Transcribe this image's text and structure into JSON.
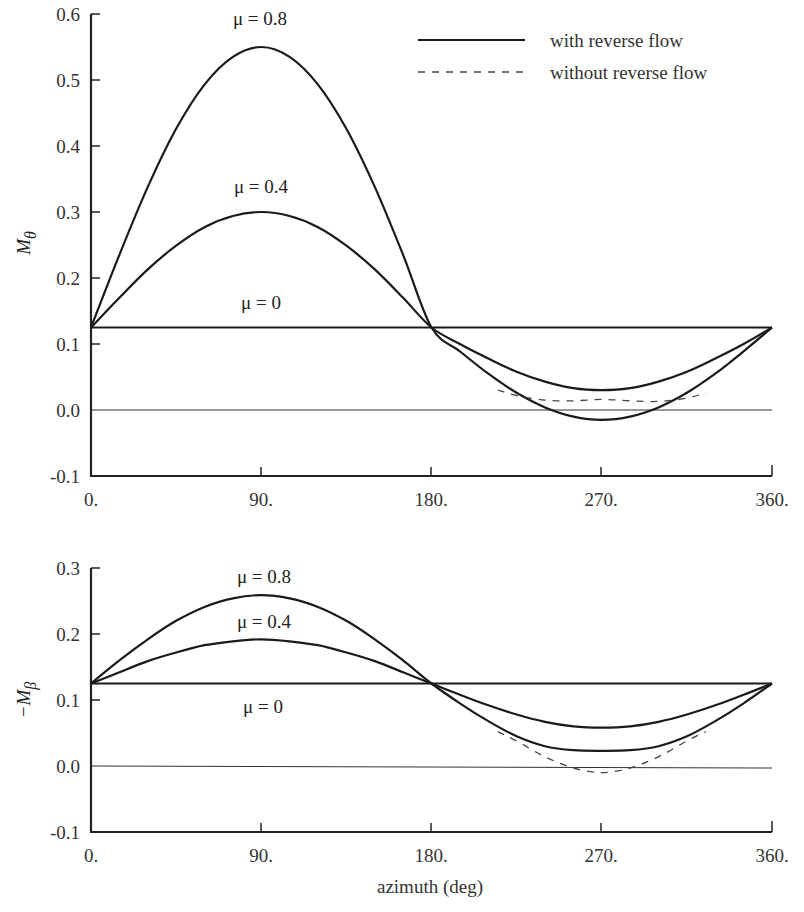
{
  "legend": {
    "solid_label": "with reverse flow",
    "dashed_label": "without reverse flow"
  },
  "xaxis": {
    "label": "azimuth (deg)",
    "ticks": [
      "0.",
      "90.",
      "180.",
      "270.",
      "360."
    ],
    "tick_values": [
      0,
      90,
      180,
      270,
      360
    ]
  },
  "top": {
    "ylabel": "M",
    "ylabel_sub": "θ",
    "yticks": [
      "0.6",
      "0.5",
      "0.4",
      "0.3",
      "0.2",
      "0.1",
      "0.0",
      "-0.1"
    ],
    "curve_labels": {
      "mu08": "μ = 0.8",
      "mu04": "μ = 0.4",
      "mu0": "μ = 0"
    }
  },
  "bottom": {
    "ylabel": "−M",
    "ylabel_sub": "β",
    "yticks": [
      "0.3",
      "0.2",
      "0.1",
      "0.0",
      "-0.1"
    ],
    "curve_labels": {
      "mu08": "μ = 0.8",
      "mu04": "μ = 0.4",
      "mu0": "μ = 0"
    }
  },
  "chart_data": [
    {
      "type": "line",
      "title": "",
      "xlabel": "azimuth (deg)",
      "ylabel": "M_θ",
      "xlim": [
        0,
        360
      ],
      "ylim": [
        -0.1,
        0.6
      ],
      "grid": false,
      "legend_position": "top-right",
      "x": [
        0,
        15,
        30,
        45,
        60,
        75,
        90,
        105,
        120,
        135,
        150,
        165,
        180,
        195,
        210,
        225,
        240,
        255,
        270,
        285,
        300,
        315,
        330,
        345,
        360
      ],
      "series": [
        {
          "name": "μ = 0 (with reverse flow)",
          "style": "solid",
          "values": [
            0.125,
            0.125,
            0.125,
            0.125,
            0.125,
            0.125,
            0.125,
            0.125,
            0.125,
            0.125,
            0.125,
            0.125,
            0.125,
            0.125,
            0.125,
            0.125,
            0.125,
            0.125,
            0.125,
            0.125,
            0.125,
            0.125,
            0.125,
            0.125,
            0.125
          ]
        },
        {
          "name": "μ = 0.4 (with reverse flow)",
          "style": "solid",
          "values": [
            0.125,
            0.17,
            0.213,
            0.249,
            0.277,
            0.294,
            0.3,
            0.294,
            0.277,
            0.249,
            0.213,
            0.17,
            0.125,
            0.1,
            0.078,
            0.058,
            0.043,
            0.033,
            0.03,
            0.033,
            0.043,
            0.058,
            0.078,
            0.1,
            0.125
          ]
        },
        {
          "name": "μ = 0.8 (with reverse flow)",
          "style": "solid",
          "values": [
            0.125,
            0.235,
            0.338,
            0.426,
            0.493,
            0.535,
            0.55,
            0.535,
            0.493,
            0.426,
            0.338,
            0.235,
            0.125,
            0.089,
            0.055,
            0.026,
            0.004,
            -0.01,
            -0.015,
            -0.01,
            0.004,
            0.026,
            0.055,
            0.089,
            0.125
          ]
        },
        {
          "name": "μ = 0.8 (without reverse flow)",
          "style": "dashed",
          "x": [
            215,
            225,
            240,
            255,
            270,
            285,
            300,
            315,
            325
          ],
          "values": [
            0.03,
            0.022,
            0.015,
            0.014,
            0.016,
            0.014,
            0.013,
            0.018,
            0.026
          ]
        }
      ]
    },
    {
      "type": "line",
      "title": "",
      "xlabel": "azimuth (deg)",
      "ylabel": "−M_β",
      "xlim": [
        0,
        360
      ],
      "ylim": [
        -0.1,
        0.3
      ],
      "grid": false,
      "x": [
        0,
        15,
        30,
        45,
        60,
        75,
        90,
        105,
        120,
        135,
        150,
        165,
        180,
        195,
        210,
        225,
        240,
        255,
        270,
        285,
        300,
        315,
        330,
        345,
        360
      ],
      "series": [
        {
          "name": "μ = 0 (with reverse flow)",
          "style": "solid",
          "values": [
            0.125,
            0.125,
            0.125,
            0.125,
            0.125,
            0.125,
            0.125,
            0.125,
            0.125,
            0.125,
            0.125,
            0.125,
            0.125,
            0.125,
            0.125,
            0.125,
            0.125,
            0.125,
            0.125,
            0.125,
            0.125,
            0.125,
            0.125,
            0.125,
            0.125
          ]
        },
        {
          "name": "μ = 0.4 (with reverse flow)",
          "style": "solid",
          "values": [
            0.125,
            0.142,
            0.159,
            0.172,
            0.183,
            0.189,
            0.192,
            0.189,
            0.183,
            0.172,
            0.159,
            0.142,
            0.125,
            0.108,
            0.092,
            0.078,
            0.067,
            0.06,
            0.058,
            0.06,
            0.067,
            0.078,
            0.092,
            0.108,
            0.125
          ]
        },
        {
          "name": "μ = 0.8 (with reverse flow)",
          "style": "solid",
          "values": [
            0.125,
            0.16,
            0.192,
            0.22,
            0.241,
            0.254,
            0.259,
            0.254,
            0.241,
            0.22,
            0.192,
            0.16,
            0.125,
            0.095,
            0.068,
            0.045,
            0.03,
            0.024,
            0.023,
            0.024,
            0.03,
            0.045,
            0.068,
            0.095,
            0.125
          ]
        },
        {
          "name": "μ = 0.8 (without reverse flow)",
          "style": "dashed",
          "x": [
            215,
            225,
            240,
            255,
            270,
            285,
            300,
            315,
            325
          ],
          "values": [
            0.052,
            0.038,
            0.014,
            -0.003,
            -0.01,
            -0.003,
            0.014,
            0.038,
            0.052
          ]
        }
      ]
    }
  ]
}
